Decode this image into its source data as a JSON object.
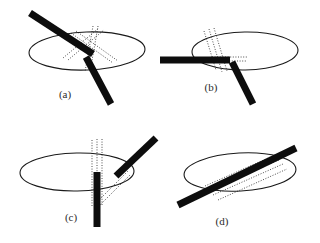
{
  "figure": {
    "background_color": "#ffffff",
    "ink_color": "#0d0d0d",
    "outline_color": "#1a1a1a",
    "dotted_color": "#3a3a3a",
    "label_color": "#2b2b2b",
    "panel_count": 4
  },
  "panels": [
    {
      "id": "a",
      "label": "(a)",
      "label_x": 65,
      "label_y": 95,
      "ellipse": {
        "cx": 87,
        "cy": 51,
        "rx": 58,
        "ry": 19,
        "rotation": -2
      },
      "rods": [
        {
          "name": "upper-left-rod",
          "x1": 30,
          "y1": 13,
          "x2": 93,
          "y2": 54,
          "width": 7
        },
        {
          "name": "lower-right-rod",
          "x1": 86,
          "y1": 57,
          "x2": 111,
          "y2": 104,
          "width": 7
        }
      ],
      "dotted_lines": [
        {
          "x1": 71,
          "y1": 33,
          "x2": 113,
          "y2": 63
        },
        {
          "x1": 76,
          "y1": 31,
          "x2": 118,
          "y2": 61
        },
        {
          "x1": 63,
          "y1": 58,
          "x2": 99,
          "y2": 28
        },
        {
          "x1": 68,
          "y1": 60,
          "x2": 104,
          "y2": 30
        },
        {
          "x1": 93,
          "y1": 26,
          "x2": 85,
          "y2": 72
        },
        {
          "x1": 98,
          "y1": 26,
          "x2": 90,
          "y2": 72
        }
      ]
    },
    {
      "id": "b",
      "label": "(b)",
      "label_x": 211,
      "label_y": 88,
      "ellipse": {
        "cx": 245,
        "cy": 51,
        "rx": 53,
        "ry": 19,
        "rotation": -1
      },
      "rods": [
        {
          "name": "left-horizontal-rod",
          "x1": 160,
          "y1": 60,
          "x2": 230,
          "y2": 60,
          "width": 7
        },
        {
          "name": "lower-right-rod",
          "x1": 232,
          "y1": 62,
          "x2": 253,
          "y2": 104,
          "width": 7
        }
      ],
      "dotted_lines": [
        {
          "x1": 212,
          "y1": 57,
          "x2": 247,
          "y2": 57
        },
        {
          "x1": 211,
          "y1": 61,
          "x2": 246,
          "y2": 61
        },
        {
          "x1": 209,
          "y1": 29,
          "x2": 222,
          "y2": 72
        },
        {
          "x1": 214,
          "y1": 28,
          "x2": 227,
          "y2": 71
        },
        {
          "x1": 204,
          "y1": 31,
          "x2": 216,
          "y2": 70
        }
      ]
    },
    {
      "id": "c",
      "label": "(c)",
      "label_x": 71,
      "label_y": 218,
      "ellipse": {
        "cx": 77,
        "cy": 172,
        "rx": 57,
        "ry": 19,
        "rotation": -1
      },
      "rods": [
        {
          "name": "upper-right-rod",
          "x1": 156,
          "y1": 138,
          "x2": 116,
          "y2": 176,
          "width": 7
        },
        {
          "name": "vertical-down-rod",
          "x1": 97,
          "y1": 172,
          "x2": 97,
          "y2": 227,
          "width": 7
        }
      ],
      "dotted_lines": [
        {
          "x1": 92,
          "y1": 140,
          "x2": 92,
          "y2": 206
        },
        {
          "x1": 97,
          "y1": 139,
          "x2": 97,
          "y2": 206
        },
        {
          "x1": 102,
          "y1": 139,
          "x2": 102,
          "y2": 205
        },
        {
          "x1": 94,
          "y1": 205,
          "x2": 128,
          "y2": 171
        },
        {
          "x1": 98,
          "y1": 207,
          "x2": 131,
          "y2": 174
        }
      ]
    },
    {
      "id": "d",
      "label": "(d)",
      "label_x": 222,
      "label_y": 222,
      "ellipse": {
        "cx": 240,
        "cy": 172,
        "rx": 56,
        "ry": 19,
        "rotation": -3
      },
      "rods": [
        {
          "name": "diagonal-through-rod",
          "x1": 178,
          "y1": 205,
          "x2": 296,
          "y2": 148,
          "width": 7
        }
      ],
      "dotted_lines": [
        {
          "x1": 209,
          "y1": 191,
          "x2": 279,
          "y2": 160
        },
        {
          "x1": 213,
          "y1": 195,
          "x2": 283,
          "y2": 164
        },
        {
          "x1": 218,
          "y1": 200,
          "x2": 287,
          "y2": 169
        },
        {
          "x1": 205,
          "y1": 186,
          "x2": 275,
          "y2": 155
        }
      ]
    }
  ]
}
